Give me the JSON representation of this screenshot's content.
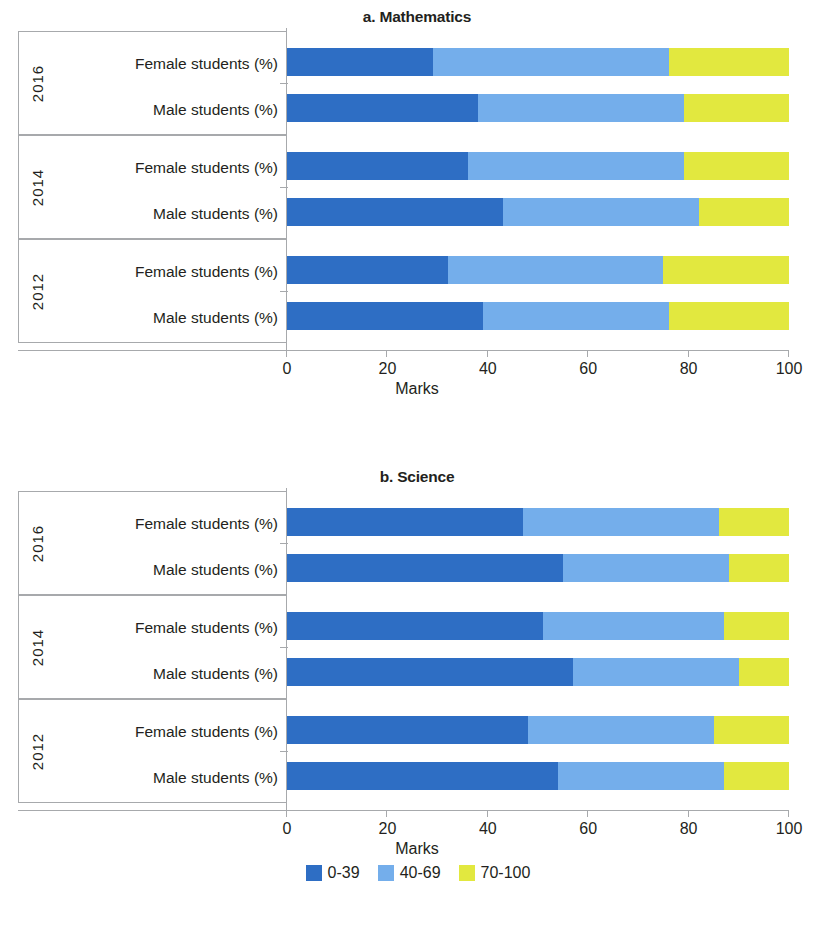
{
  "colors": {
    "band_0_39": "#2e6ec4",
    "band_40_69": "#74aeeb",
    "band_70_100": "#e2e83f",
    "axis": "#a7a9ac",
    "text": "#231f20"
  },
  "panels": [
    {
      "id": "math",
      "title": "a. Mathematics",
      "xlabel": "Marks"
    },
    {
      "id": "sci",
      "title": "b. Science",
      "xlabel": "Marks"
    }
  ],
  "axis": {
    "ticks": [
      0,
      20,
      40,
      60,
      80,
      100
    ],
    "tick_labels": [
      "0",
      "20",
      "40",
      "60",
      "80",
      "100"
    ],
    "xlabel": "Marks",
    "xlim": [
      0,
      100
    ]
  },
  "groups": {
    "years": [
      "2016",
      "2014",
      "2012"
    ],
    "series": [
      "Female students (%)",
      "Male students (%)"
    ]
  },
  "legend": {
    "position": "bottom-center",
    "items": [
      {
        "label": "0-39",
        "color": "#2e6ec4"
      },
      {
        "label": "40-69",
        "color": "#74aeeb"
      },
      {
        "label": "70-100",
        "color": "#e2e83f"
      }
    ]
  },
  "chart_data": [
    {
      "type": "bar",
      "orientation": "horizontal",
      "stacked": true,
      "title": "a. Mathematics",
      "xlabel": "Marks",
      "ylabel": "",
      "xlim": [
        0,
        100
      ],
      "grid": false,
      "legend": [
        "0-39",
        "40-69",
        "70-100"
      ],
      "categories": [
        "2016 Female students (%)",
        "2016 Male students (%)",
        "2014 Female students (%)",
        "2014 Male students (%)",
        "2012 Female students (%)",
        "2012 Male students (%)"
      ],
      "series": [
        {
          "name": "0-39",
          "color": "#2e6ec4",
          "values": [
            29,
            38,
            36,
            43,
            32,
            39
          ]
        },
        {
          "name": "40-69",
          "color": "#74aeeb",
          "values": [
            47,
            41,
            43,
            39,
            43,
            37
          ]
        },
        {
          "name": "70-100",
          "color": "#e2e83f",
          "values": [
            24,
            21,
            21,
            18,
            25,
            24
          ]
        }
      ]
    },
    {
      "type": "bar",
      "orientation": "horizontal",
      "stacked": true,
      "title": "b. Science",
      "xlabel": "Marks",
      "ylabel": "",
      "xlim": [
        0,
        100
      ],
      "grid": false,
      "legend": [
        "0-39",
        "40-69",
        "70-100"
      ],
      "categories": [
        "2016 Female students (%)",
        "2016 Male students (%)",
        "2014 Female students (%)",
        "2014 Male students (%)",
        "2012 Female students (%)",
        "2012 Male students (%)"
      ],
      "series": [
        {
          "name": "0-39",
          "color": "#2e6ec4",
          "values": [
            47,
            55,
            51,
            57,
            48,
            54
          ]
        },
        {
          "name": "40-69",
          "color": "#74aeeb",
          "values": [
            39,
            33,
            36,
            33,
            37,
            33
          ]
        },
        {
          "name": "70-100",
          "color": "#e2e83f",
          "values": [
            14,
            12,
            13,
            10,
            15,
            13
          ]
        }
      ]
    }
  ]
}
